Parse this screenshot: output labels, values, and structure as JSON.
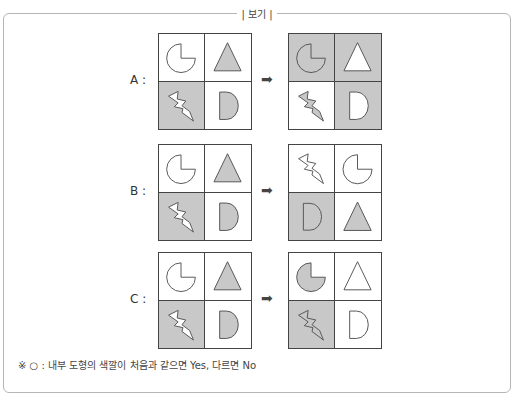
{
  "header": {
    "label": "| 보기 |"
  },
  "colors": {
    "shade": "#c8c8c8",
    "white": "#ffffff",
    "stroke": "#555555"
  },
  "rows": [
    {
      "label": "A :",
      "top": 33,
      "before": [
        {
          "shape": "pie",
          "cell": "white",
          "fill": "white"
        },
        {
          "shape": "triangle",
          "cell": "white",
          "fill": "shade"
        },
        {
          "shape": "bolt",
          "cell": "shade",
          "fill": "white"
        },
        {
          "shape": "d",
          "cell": "white",
          "fill": "shade"
        }
      ],
      "after": [
        {
          "shape": "pie",
          "cell": "shade",
          "fill": "shade"
        },
        {
          "shape": "triangle",
          "cell": "shade",
          "fill": "white"
        },
        {
          "shape": "bolt",
          "cell": "white",
          "fill": "shade"
        },
        {
          "shape": "d",
          "cell": "shade",
          "fill": "white"
        }
      ]
    },
    {
      "label": "B :",
      "top": 144,
      "before": [
        {
          "shape": "pie",
          "cell": "white",
          "fill": "white"
        },
        {
          "shape": "triangle",
          "cell": "white",
          "fill": "shade"
        },
        {
          "shape": "bolt",
          "cell": "shade",
          "fill": "white"
        },
        {
          "shape": "d",
          "cell": "white",
          "fill": "shade"
        }
      ],
      "after": [
        {
          "shape": "bolt",
          "cell": "white",
          "fill": "white"
        },
        {
          "shape": "pie",
          "cell": "white",
          "fill": "white"
        },
        {
          "shape": "d",
          "cell": "shade",
          "fill": "shade"
        },
        {
          "shape": "triangle",
          "cell": "white",
          "fill": "shade"
        }
      ]
    },
    {
      "label": "C :",
      "top": 252,
      "before": [
        {
          "shape": "pie",
          "cell": "white",
          "fill": "white"
        },
        {
          "shape": "triangle",
          "cell": "white",
          "fill": "shade"
        },
        {
          "shape": "bolt",
          "cell": "shade",
          "fill": "white"
        },
        {
          "shape": "d",
          "cell": "white",
          "fill": "shade"
        }
      ],
      "after": [
        {
          "shape": "pie",
          "cell": "white",
          "fill": "shade"
        },
        {
          "shape": "triangle",
          "cell": "white",
          "fill": "white"
        },
        {
          "shape": "bolt",
          "cell": "shade",
          "fill": "shade"
        },
        {
          "shape": "d",
          "cell": "white",
          "fill": "white"
        }
      ]
    }
  ],
  "arrow": "➡",
  "note": "※ ○ : 내부 도형의 색깔이 처음과 같으면 Yes, 다르면 No"
}
